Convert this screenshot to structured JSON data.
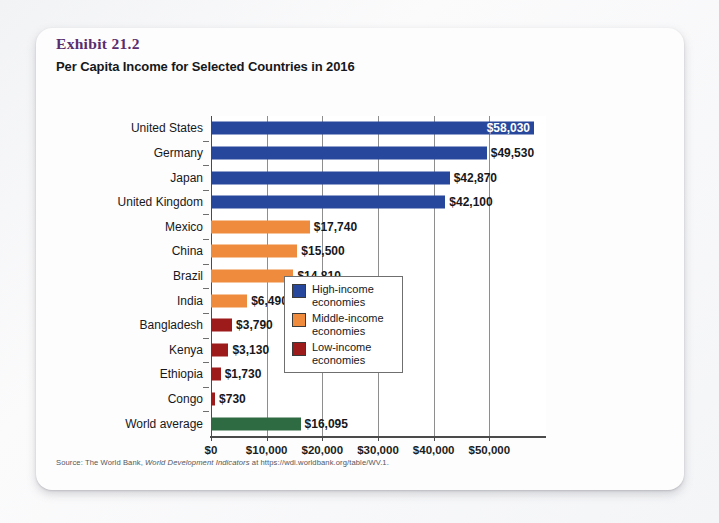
{
  "exhibit": {
    "number": "Exhibit 21.2",
    "title": "Per Capita Income for Selected Countries in 2016",
    "number_color": "#5a2d6e"
  },
  "source": {
    "prefix": "Source: The World Bank, ",
    "italic": "World Development Indicators",
    "suffix": " at https://wdi.worldbank.org/table/WV.1."
  },
  "legend": {
    "position": "inside-right-middle",
    "items": [
      {
        "label_line1": "High-income",
        "label_line2": "economies",
        "color": "#26479b"
      },
      {
        "label_line1": "Middle-income",
        "label_line2": "economies",
        "color": "#ef8b3c"
      },
      {
        "label_line1": "Low-income",
        "label_line2": "economies",
        "color": "#9e1b1b"
      }
    ]
  },
  "chart_data": {
    "type": "bar",
    "orientation": "horizontal",
    "title": "Per Capita Income for Selected Countries in 2016",
    "xlabel": "",
    "ylabel": "",
    "xlim": [
      0,
      60000
    ],
    "grid": true,
    "xticks": [
      0,
      10000,
      20000,
      30000,
      40000,
      50000
    ],
    "xtick_labels": [
      "$0",
      "$10,000",
      "$20,000",
      "$30,000",
      "$40,000",
      "$50,000"
    ],
    "categories": [
      "United States",
      "Germany",
      "Japan",
      "United Kingdom",
      "Mexico",
      "China",
      "Brazil",
      "India",
      "Bangladesh",
      "Kenya",
      "Ethiopia",
      "Congo",
      "World average"
    ],
    "values": [
      58030,
      49530,
      42870,
      42100,
      17740,
      15500,
      14810,
      6490,
      3790,
      3130,
      1730,
      730,
      16095
    ],
    "value_labels": [
      "$58,030",
      "$49,530",
      "$42,870",
      "$42,100",
      "$17,740",
      "$15,500",
      "$14,810",
      "$6,490",
      "$3,790",
      "$3,130",
      "$1,730",
      "$730",
      "$16,095"
    ],
    "groups": [
      "high-income",
      "high-income",
      "high-income",
      "high-income",
      "middle-income",
      "middle-income",
      "middle-income",
      "middle-income",
      "low-income",
      "low-income",
      "low-income",
      "low-income",
      "world-average"
    ],
    "colors": {
      "high-income": "#26479b",
      "middle-income": "#ef8b3c",
      "low-income": "#9e1b1b",
      "world-average": "#2e6b42"
    }
  }
}
